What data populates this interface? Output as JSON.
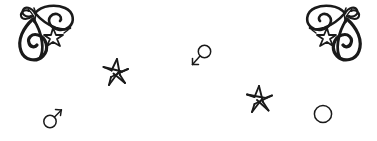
{
  "canvas": {
    "width": 377,
    "height": 141,
    "background_color": "#ffffff",
    "ink_color": "#1a1a1a",
    "description": "Hand-drawn doodle composition on a blank white background"
  },
  "elements": [
    {
      "id": "ornament-left",
      "name": "calligraphic-flourish-ornament-left",
      "label": "Calligraphic flourish ornament with star",
      "x": 12,
      "y": 2,
      "width": 66,
      "height": 63,
      "mirrored": false
    },
    {
      "id": "ornament-right",
      "name": "calligraphic-flourish-ornament-right",
      "label": "Calligraphic flourish ornament with star (mirrored)",
      "x": 302,
      "y": 2,
      "width": 66,
      "height": 63,
      "mirrored": true
    },
    {
      "id": "star-left",
      "name": "hand-drawn-star-left",
      "label": "Hand-drawn five-pointed star",
      "x": 102,
      "y": 58,
      "width": 28,
      "height": 28
    },
    {
      "id": "star-right",
      "name": "hand-drawn-star-right",
      "label": "Hand-drawn five-pointed star",
      "x": 246,
      "y": 85,
      "width": 28,
      "height": 28
    },
    {
      "id": "mars-symbol-rotated",
      "name": "mars-symbol-rotated",
      "label": "Mars symbol rotated, arrow pointing down-left",
      "x": 190,
      "y": 44,
      "width": 22,
      "height": 24
    },
    {
      "id": "mars-symbol",
      "name": "mars-symbol",
      "label": "Mars symbol, arrow pointing up-right",
      "x": 42,
      "y": 105,
      "width": 20,
      "height": 24
    },
    {
      "id": "plain-circle",
      "name": "plain-circle",
      "label": "Plain circle outline",
      "x": 313,
      "y": 104,
      "width": 20,
      "height": 20
    }
  ]
}
